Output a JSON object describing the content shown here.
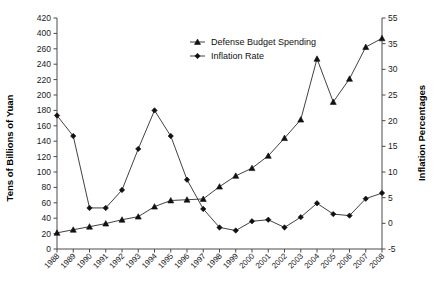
{
  "chart_data": {
    "type": "line",
    "title": "",
    "xlabel": "",
    "ylabel": "Tens of Billions of Yuan",
    "y2label": "Inflation Percentages",
    "grid": false,
    "legend_position": "top-center",
    "categories": [
      "1988",
      "1989",
      "1990",
      "1991",
      "1992",
      "1993",
      "1994",
      "1995",
      "1996",
      "1997",
      "1998",
      "1999",
      "2000",
      "2001",
      "2002",
      "2003",
      "2004",
      "2005",
      "2006",
      "2007",
      "2008"
    ],
    "left_axis": {
      "label": "Tens of Billions of Yuan",
      "ticks": [
        "0",
        "20",
        "40",
        "60",
        "80",
        "100",
        "120",
        "140",
        "160",
        "180",
        "200",
        "220",
        "240",
        "260",
        "400",
        "420"
      ],
      "ylim": [
        0,
        420
      ]
    },
    "right_axis": {
      "label": "Inflation Percentages",
      "ticks": [
        "-5",
        "0",
        "5",
        "10",
        "15",
        "20",
        "25",
        "30",
        "35",
        "55"
      ],
      "ylim": [
        -5,
        55
      ]
    },
    "series": [
      {
        "name": "Defense Budget Spending",
        "axis": "left",
        "marker": "triangle",
        "unit": "Tens of Billions of Yuan",
        "values": [
          21,
          25,
          29,
          33,
          38,
          42,
          55,
          63,
          64,
          65,
          81,
          95,
          105,
          121,
          144,
          168,
          247,
          191,
          221,
          276,
          355
        ]
      },
      {
        "name": "Inflation Rate",
        "axis": "right",
        "marker": "diamond",
        "unit": "percent",
        "values": [
          21.0,
          17.0,
          3.0,
          3.0,
          6.5,
          14.5,
          22.0,
          17.0,
          8.5,
          2.8,
          -0.8,
          -1.4,
          0.4,
          0.7,
          -0.8,
          1.2,
          3.9,
          1.8,
          1.5,
          4.8,
          5.9
        ]
      }
    ],
    "legend": [
      {
        "label": "Defense Budget Spending",
        "marker": "triangle"
      },
      {
        "label": "Inflation Rate",
        "marker": "diamond"
      }
    ]
  }
}
